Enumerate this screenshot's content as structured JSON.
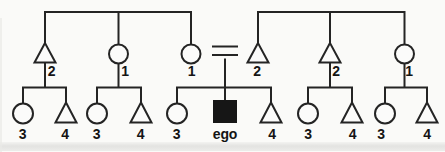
{
  "diagram": {
    "kind": "kinship-diagram",
    "marriage_symbol": "=",
    "ego_label": "ego",
    "parent_generation": [
      {
        "kin_symbol": "male-triangle",
        "term": "2"
      },
      {
        "kin_symbol": "female-circle",
        "term": "1"
      },
      {
        "kin_symbol": "female-circle",
        "term": "1"
      },
      {
        "kin_symbol": "male-triangle",
        "term": "2"
      },
      {
        "kin_symbol": "male-triangle",
        "term": "2"
      },
      {
        "kin_symbol": "female-circle",
        "term": "1"
      }
    ],
    "child_generation": [
      {
        "kin_symbol": "female-circle",
        "term": "3"
      },
      {
        "kin_symbol": "male-triangle",
        "term": "4"
      },
      {
        "kin_symbol": "female-circle",
        "term": "3"
      },
      {
        "kin_symbol": "male-triangle",
        "term": "4"
      },
      {
        "kin_symbol": "female-circle",
        "term": "3"
      },
      {
        "kin_symbol": "ego-filled-square",
        "term": "ego"
      },
      {
        "kin_symbol": "male-triangle",
        "term": "4"
      },
      {
        "kin_symbol": "female-circle",
        "term": "3"
      },
      {
        "kin_symbol": "male-triangle",
        "term": "4"
      },
      {
        "kin_symbol": "female-circle",
        "term": "3"
      },
      {
        "kin_symbol": "male-triangle",
        "term": "4"
      }
    ],
    "families": [
      {
        "parents": [
          0
        ],
        "children": [
          0,
          1
        ]
      },
      {
        "parents": [
          1
        ],
        "children": [
          2,
          3
        ]
      },
      {
        "parents": [
          2,
          3
        ],
        "children": [
          4,
          5,
          6
        ]
      },
      {
        "parents": [
          4
        ],
        "children": [
          7,
          8
        ]
      },
      {
        "parents": [
          5
        ],
        "children": [
          9,
          10
        ]
      }
    ],
    "colors": {
      "line": "#242424",
      "label": "#141414",
      "ego_fill": "#161616",
      "background": "#fafaf8"
    }
  }
}
